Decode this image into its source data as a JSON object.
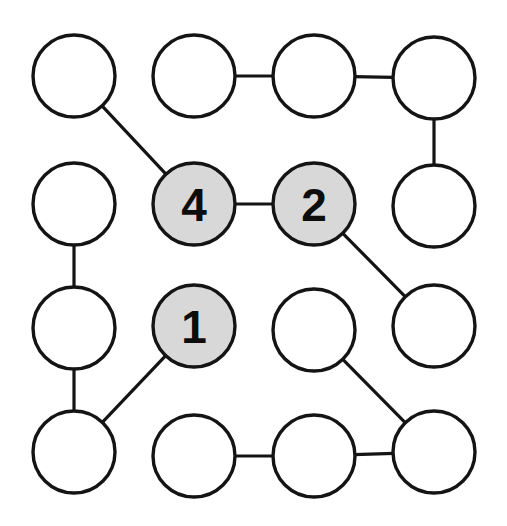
{
  "diagram": {
    "background_color": "#ffffff",
    "stroke_color": "#141414",
    "node_fill_plain": "#ffffff",
    "node_fill_highlight": "#d8d8d8",
    "label_color": "#0d0d0d",
    "node_radius": 41,
    "edge_width": 3.2,
    "grid": {
      "rows": 4,
      "cols": 4,
      "col_x": [
        74,
        194,
        314,
        434
      ],
      "row_y": [
        76,
        204,
        328,
        450
      ]
    }
  },
  "nodes": [
    {
      "id": "r1c1",
      "row": 1,
      "col": 1,
      "cx": 74,
      "cy": 76,
      "label": "",
      "highlighted": false
    },
    {
      "id": "r1c2",
      "row": 1,
      "col": 2,
      "cx": 194,
      "cy": 76,
      "label": "",
      "highlighted": false
    },
    {
      "id": "r1c3",
      "row": 1,
      "col": 3,
      "cx": 314,
      "cy": 76,
      "label": "",
      "highlighted": false
    },
    {
      "id": "r1c4",
      "row": 1,
      "col": 4,
      "cx": 434,
      "cy": 78,
      "label": "",
      "highlighted": false
    },
    {
      "id": "r2c1",
      "row": 2,
      "col": 1,
      "cx": 74,
      "cy": 204,
      "label": "",
      "highlighted": false
    },
    {
      "id": "r2c2",
      "row": 2,
      "col": 2,
      "cx": 194,
      "cy": 204,
      "label": "4",
      "highlighted": true
    },
    {
      "id": "r2c3",
      "row": 2,
      "col": 3,
      "cx": 314,
      "cy": 204,
      "label": "2",
      "highlighted": true
    },
    {
      "id": "r2c4",
      "row": 2,
      "col": 4,
      "cx": 434,
      "cy": 206,
      "label": "",
      "highlighted": false
    },
    {
      "id": "r3c1",
      "row": 3,
      "col": 1,
      "cx": 74,
      "cy": 328,
      "label": "",
      "highlighted": false
    },
    {
      "id": "r3c2",
      "row": 3,
      "col": 2,
      "cx": 194,
      "cy": 326,
      "label": "1",
      "highlighted": true
    },
    {
      "id": "r3c3",
      "row": 3,
      "col": 3,
      "cx": 314,
      "cy": 330,
      "label": "",
      "highlighted": false
    },
    {
      "id": "r3c4",
      "row": 3,
      "col": 4,
      "cx": 434,
      "cy": 326,
      "label": "",
      "highlighted": false
    },
    {
      "id": "r4c1",
      "row": 4,
      "col": 1,
      "cx": 74,
      "cy": 452,
      "label": "",
      "highlighted": false
    },
    {
      "id": "r4c2",
      "row": 4,
      "col": 2,
      "cx": 194,
      "cy": 456,
      "label": "",
      "highlighted": false
    },
    {
      "id": "r4c3",
      "row": 4,
      "col": 3,
      "cx": 314,
      "cy": 456,
      "label": "",
      "highlighted": false
    },
    {
      "id": "r4c4",
      "row": 4,
      "col": 4,
      "cx": 434,
      "cy": 452,
      "label": "",
      "highlighted": false
    }
  ],
  "edges": [
    {
      "from": "r1c2",
      "to": "r1c3"
    },
    {
      "from": "r1c3",
      "to": "r1c4"
    },
    {
      "from": "r1c1",
      "to": "r2c2"
    },
    {
      "from": "r1c4",
      "to": "r2c4"
    },
    {
      "from": "r2c1",
      "to": "r3c1"
    },
    {
      "from": "r2c2",
      "to": "r2c3"
    },
    {
      "from": "r2c3",
      "to": "r3c4"
    },
    {
      "from": "r3c1",
      "to": "r4c1"
    },
    {
      "from": "r3c2",
      "to": "r4c1"
    },
    {
      "from": "r3c3",
      "to": "r4c4"
    },
    {
      "from": "r4c2",
      "to": "r4c3"
    },
    {
      "from": "r4c3",
      "to": "r4c4"
    }
  ],
  "highlighted_labels": [
    "1",
    "2",
    "4"
  ]
}
